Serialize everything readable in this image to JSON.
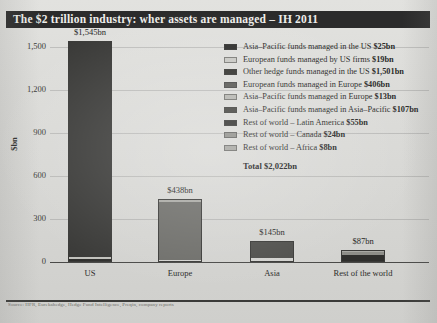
{
  "title": "The $2 trillion industry: wher assets are managed – IH 2011",
  "footer_note": "Source: HFR, Eurekahedge, Hedge Fund Intelligence, Preqin, company reports",
  "colors": {
    "dark": "#2f2f2d",
    "mid_dark": "#4f4f4c",
    "mid": "#6e6e6a",
    "light": "#a9a9a4",
    "lighter": "#c2c2bd",
    "page_bg": "#d9d9d6",
    "title_bg": "#2b2b2b",
    "title_fg": "#eeeeea"
  },
  "chart_data": {
    "type": "bar",
    "title": "The $2 trillion industry: wher assets are managed – IH 2011",
    "xlabel": "",
    "ylabel": "$bn",
    "ylim": [
      0,
      1650
    ],
    "yticks": [
      0,
      300,
      600,
      900,
      1200,
      1500
    ],
    "ytick_labels": [
      "0",
      "300",
      "600",
      "900",
      "1,200",
      "1,500"
    ],
    "grid": true,
    "legend_position": "top-right",
    "stacked": true,
    "categories": [
      "US",
      "Europe",
      "Asia",
      "Rest of the world"
    ],
    "bar_totals": [
      1545,
      438,
      145,
      87
    ],
    "bar_total_labels": [
      "$1,545bn",
      "$438bn",
      "$145bn",
      "$87bn"
    ],
    "series": [
      {
        "name": "Asia-Pacific funds managed in the US",
        "value": 25,
        "value_label": "$25bn",
        "color": "#2f2f2d",
        "category": "US"
      },
      {
        "name": "European funds managed by US firms",
        "value": 19,
        "value_label": "$19bn",
        "color": "#c2c2bd",
        "category": "US"
      },
      {
        "name": "Other hedge funds managed in the US",
        "value": 1501,
        "value_label": "$1,501bn",
        "color": "#3a3a38",
        "category": "US"
      },
      {
        "name": "European funds managed in Europe",
        "value": 406,
        "value_label": "$406bn",
        "color": "#6e6e6a",
        "category": "Europe"
      },
      {
        "name": "Asia-Pacific funds managed in Europe",
        "value": 13,
        "value_label": "$13bn",
        "color": "#a9a9a4",
        "category": "Europe"
      },
      {
        "name": "Asia-Pacific funds managed in Asia-Pacific",
        "value": 107,
        "value_label": "$107bn",
        "color": "#4f4f4c",
        "category": "Asia"
      },
      {
        "name": "Rest of world – Latin America",
        "value": 55,
        "value_label": "$55bn",
        "color": "#2f2f2d",
        "category": "Rest of the world"
      },
      {
        "name": "Rest of world – Canada",
        "value": 24,
        "value_label": "$24bn",
        "color": "#8d8d88",
        "category": "Rest of the world"
      },
      {
        "name": "Rest of world – Africa",
        "value": 8,
        "value_label": "$8bn",
        "color": "#a9a9a4",
        "category": "Rest of the world"
      }
    ],
    "total_label": "Total $2,022bn",
    "total_value": 2022
  },
  "legend": {
    "items": [
      {
        "label": "Asia–Pacific funds managed in the US",
        "value": "$25bn",
        "color": "#2f2f2d"
      },
      {
        "label": "European funds managed by US firms",
        "value": "$19bn",
        "color": "#c9c9c4"
      },
      {
        "label": "Other hedge funds managed in the US",
        "value": "$1,501bn",
        "color": "#33332f"
      },
      {
        "label": "European funds managed in Europe",
        "value": "$406bn",
        "color": "#585854"
      },
      {
        "label": "Asia–Pacific funds managed in Europe",
        "value": "$13bn",
        "color": "#b5b5b0"
      },
      {
        "label": "Asia–Pacific funds managed in Asia–Pacific",
        "value": "$107bn",
        "color": "#43433f"
      },
      {
        "label": "Rest of world – Latin America",
        "value": "$55bn",
        "color": "#2f2f2d"
      },
      {
        "label": "Rest of world – Canada",
        "value": "$24bn",
        "color": "#8d8d88"
      },
      {
        "label": "Rest of world – Africa",
        "value": "$8bn",
        "color": "#a3a39e"
      }
    ],
    "total": "Total $2,022bn"
  }
}
